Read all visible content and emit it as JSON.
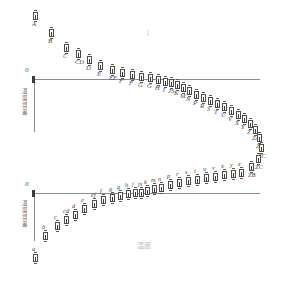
{
  "chart_data": [
    {
      "type": "scatter",
      "title": "Upper hysteresis branch (error-bar markers)",
      "subtitle": "",
      "xlabel": "",
      "ylabel": "温度误差",
      "origin_tick_label": "0",
      "top_annotation": "1",
      "grid": false,
      "legend": "none",
      "xlim": [
        0,
        281
      ],
      "ylim": [
        -60,
        100
      ],
      "axis_y_px": 79,
      "points": [
        {
          "label": "A",
          "x": 33,
          "y": 12
        },
        {
          "label": "B",
          "x": 49,
          "y": 29
        },
        {
          "label": "C",
          "x": 64,
          "y": 44
        },
        {
          "label": "CD",
          "x": 76,
          "y": 50
        },
        {
          "label": "D",
          "x": 87,
          "y": 56
        },
        {
          "label": "E",
          "x": 98,
          "y": 62
        },
        {
          "label": "EF",
          "x": 110,
          "y": 66
        },
        {
          "label": "F",
          "x": 120,
          "y": 69
        },
        {
          "label": "F",
          "x": 130,
          "y": 71
        },
        {
          "label": "G",
          "x": 139,
          "y": 73
        },
        {
          "label": "G",
          "x": 148,
          "y": 74
        },
        {
          "label": "H",
          "x": 156,
          "y": 76
        },
        {
          "label": "J",
          "x": 163,
          "y": 78
        },
        {
          "label": "JS",
          "x": 169,
          "y": 79
        },
        {
          "label": "K",
          "x": 175,
          "y": 81
        },
        {
          "label": "M",
          "x": 181,
          "y": 84
        },
        {
          "label": "N",
          "x": 187,
          "y": 87
        },
        {
          "label": "P",
          "x": 194,
          "y": 91
        },
        {
          "label": "R",
          "x": 201,
          "y": 94
        },
        {
          "label": "S",
          "x": 208,
          "y": 97
        },
        {
          "label": "T",
          "x": 215,
          "y": 100
        },
        {
          "label": "U",
          "x": 222,
          "y": 103
        },
        {
          "label": "V",
          "x": 229,
          "y": 107
        },
        {
          "label": "X",
          "x": 236,
          "y": 111
        },
        {
          "label": "Y",
          "x": 242,
          "y": 115
        },
        {
          "label": "Z",
          "x": 248,
          "y": 120
        },
        {
          "label": "ZA",
          "x": 253,
          "y": 126
        },
        {
          "label": "ZB",
          "x": 257,
          "y": 134
        },
        {
          "label": "ZC",
          "x": 259,
          "y": 144
        },
        {
          "label": "ZC",
          "x": 256,
          "y": 155
        },
        {
          "label": "ZB",
          "x": 249,
          "y": 163
        }
      ]
    },
    {
      "type": "scatter",
      "title": "Lower hysteresis branch (error-bar markers)",
      "subtitle": "",
      "xlabel": "温度",
      "ylabel": "温度误差",
      "origin_tick_label": "0",
      "grid": false,
      "legend": "none",
      "xlim": [
        0,
        281
      ],
      "ylim": [
        -60,
        60
      ],
      "axis_y_px": 193,
      "points": [
        {
          "label": "a",
          "x": 33,
          "y": 254
        },
        {
          "label": "b",
          "x": 43,
          "y": 232
        },
        {
          "label": "c",
          "x": 55,
          "y": 222
        },
        {
          "label": "cd",
          "x": 64,
          "y": 216
        },
        {
          "label": "d",
          "x": 73,
          "y": 211
        },
        {
          "label": "e",
          "x": 82,
          "y": 205
        },
        {
          "label": "ef",
          "x": 92,
          "y": 200
        },
        {
          "label": "f",
          "x": 101,
          "y": 196
        },
        {
          "label": "g",
          "x": 110,
          "y": 194
        },
        {
          "label": "g",
          "x": 118,
          "y": 192
        },
        {
          "label": "h",
          "x": 126,
          "y": 190
        },
        {
          "label": "j",
          "x": 133,
          "y": 189
        },
        {
          "label": "js",
          "x": 139,
          "y": 189
        },
        {
          "label": "k",
          "x": 145,
          "y": 187
        },
        {
          "label": "m",
          "x": 152,
          "y": 185
        },
        {
          "label": "n",
          "x": 159,
          "y": 184
        },
        {
          "label": "p",
          "x": 168,
          "y": 181
        },
        {
          "label": "r",
          "x": 177,
          "y": 179
        },
        {
          "label": "s",
          "x": 186,
          "y": 177
        },
        {
          "label": "t",
          "x": 195,
          "y": 176
        },
        {
          "label": "u",
          "x": 204,
          "y": 174
        },
        {
          "label": "v",
          "x": 213,
          "y": 173
        },
        {
          "label": "x",
          "x": 222,
          "y": 171
        },
        {
          "label": "y",
          "x": 231,
          "y": 170
        },
        {
          "label": "z",
          "x": 239,
          "y": 169
        }
      ]
    }
  ],
  "upper": {
    "origin_label": "0",
    "ylabel": "温度误差",
    "top_annotation": "1"
  },
  "lower": {
    "origin_label": "0",
    "ylabel": "温度误差",
    "xlabel": "温度"
  }
}
